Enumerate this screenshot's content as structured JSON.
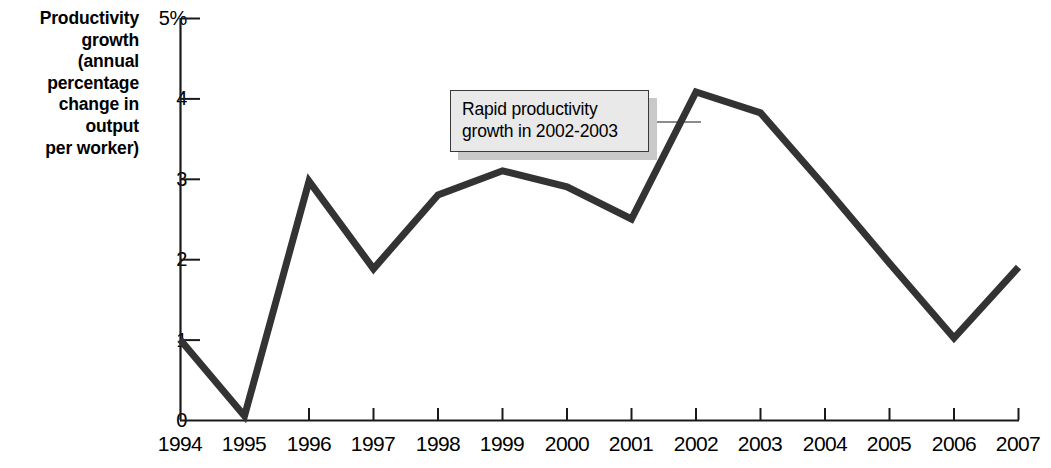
{
  "chart_data": {
    "type": "line",
    "title": "",
    "ylabel": "Productivity growth (annual percentage change in output per worker)",
    "xlabel": "",
    "categories": [
      1994,
      1995,
      1996,
      1997,
      1998,
      1999,
      2000,
      2001,
      2002,
      2003,
      2004,
      2005,
      2006,
      2007
    ],
    "x_tick_labels": [
      "1994",
      "1995",
      "1996",
      "1997",
      "1998",
      "1999",
      "2000",
      "2001",
      "2002",
      "2003",
      "2004",
      "2005",
      "2006",
      "2007"
    ],
    "values": [
      1.0,
      0.05,
      2.97,
      1.88,
      2.8,
      3.1,
      2.9,
      2.5,
      4.08,
      3.82,
      2.9,
      1.95,
      1.02,
      1.9
    ],
    "series": [
      {
        "name": "Productivity growth",
        "values": [
          1.0,
          0.05,
          2.97,
          1.88,
          2.8,
          3.1,
          2.9,
          2.5,
          4.08,
          3.82,
          2.9,
          1.95,
          1.02,
          1.9
        ]
      }
    ],
    "ylim": [
      0,
      5
    ],
    "y_ticks": [
      0,
      1,
      2,
      3,
      4,
      5
    ],
    "y_tick_labels": [
      "0",
      "1",
      "2",
      "3",
      "4",
      "5%"
    ],
    "grid": false,
    "legend": false,
    "legend_position": "none",
    "line_color": "#333333",
    "line_width": 7,
    "annotations": [
      {
        "text": "Rapid productivity\ngrowth in 2002-2003",
        "points_to_year": 2002,
        "connector": "leader-line"
      }
    ]
  },
  "axis": {
    "y_title": "Productivity\ngrowth\n(annual\npercentage\nchange in\noutput\nper worker)",
    "y_tick_labels": [
      "5%",
      "4",
      "3",
      "2",
      "1",
      "0"
    ],
    "x_tick_labels": [
      "1994",
      "1995",
      "1996",
      "1997",
      "1998",
      "1999",
      "2000",
      "2001",
      "2002",
      "2003",
      "2004",
      "2005",
      "2006",
      "2007"
    ],
    "axis_color": "#1a1a1a"
  },
  "callout": {
    "text": "Rapid productivity\ngrowth in 2002-2003",
    "fill_color": "#e9e9e9",
    "border_color": "#3a3a3a",
    "shadow_color": "#c9c9c9",
    "connector_color": "#8c8c8c"
  }
}
